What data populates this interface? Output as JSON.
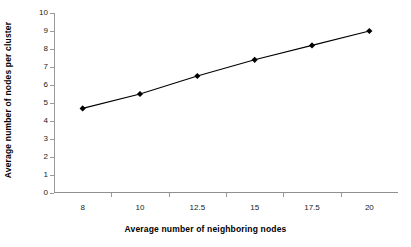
{
  "chart_data": {
    "type": "line",
    "title": "",
    "xlabel": "Average number of neighboring nodes",
    "ylabel": "Average number of nodes per cluster",
    "categories": [
      "8",
      "10",
      "12.5",
      "15",
      "17.5",
      "20"
    ],
    "values": [
      4.7,
      5.5,
      6.5,
      7.4,
      8.2,
      9.0
    ],
    "series": [
      {
        "name": "Average number of nodes per cluster",
        "values": [
          4.7,
          5.5,
          6.5,
          7.4,
          8.2,
          9.0
        ]
      }
    ],
    "ylim": [
      0,
      10
    ],
    "ytick_labels": [
      "0",
      "1",
      "2",
      "3",
      "4",
      "5",
      "6",
      "7",
      "8",
      "9",
      "10"
    ],
    "ytick_values": [
      0,
      1,
      2,
      3,
      4,
      5,
      6,
      7,
      8,
      9,
      10
    ],
    "grid": false,
    "legend": false,
    "legend_position": "none",
    "marker": "diamond",
    "line_color": "#000000",
    "marker_color": "#000000",
    "axis_color": "#8f8f8f",
    "background_color": "#ffffff"
  }
}
